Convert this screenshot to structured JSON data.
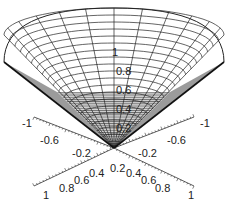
{
  "chart_data": {
    "type": "surface3d",
    "title": "",
    "surface": "cone z = sqrt(x^2 + y^2)",
    "x_range": [
      -1,
      1
    ],
    "y_range": [
      -1,
      1
    ],
    "z_range": [
      0,
      1
    ],
    "mesh": true,
    "colors": {
      "mesh_line": "#222222",
      "inner_surface": "#ffffff",
      "lower_shading": "#9a9a9a",
      "background": "#ffffff"
    },
    "z_axis": {
      "tick_labels": [
        "0.2",
        "0.4",
        "0.6",
        "0.8",
        "1"
      ]
    },
    "x_axis_back": {
      "tick_labels": [
        "-1",
        "-0.6",
        "-0.2"
      ]
    },
    "y_axis_back": {
      "tick_labels": [
        "-1",
        "-0.6",
        "-0.2"
      ]
    },
    "x_axis_front": {
      "tick_labels": [
        "0.2",
        "0.4",
        "0.6",
        "0.8",
        "1"
      ]
    },
    "y_axis_front": {
      "tick_labels": [
        "0.4",
        "0.6",
        "0.8",
        "1"
      ]
    }
  },
  "labels": {
    "z": [
      "1",
      "0.8",
      "0.6",
      "0.4",
      "0.2"
    ],
    "back_left": [
      "-1",
      "-0.6",
      "-0.2"
    ],
    "back_right": [
      "-1",
      "-0.6",
      "-0.2"
    ],
    "front_left": [
      "0.2",
      "0.4",
      "0.6",
      "0.8",
      "1"
    ],
    "front_right": [
      "0.4",
      "0.6",
      "0.8",
      "1"
    ]
  }
}
